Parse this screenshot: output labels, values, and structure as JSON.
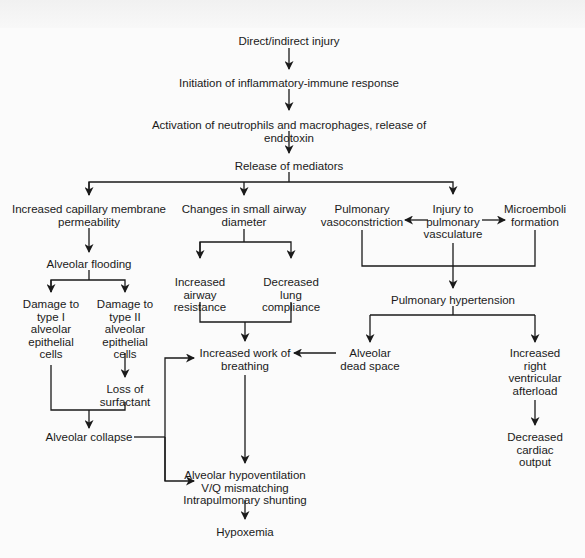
{
  "diagram": {
    "type": "flowchart",
    "nodes": {
      "injury": "Direct/indirect injury",
      "inflammatory": "Initiation of inflammatory-immune response",
      "activation": "Activation of neutrophils and macrophages, release of endotoxin",
      "mediators": "Release of mediators",
      "permeability": "Increased capillary membrane\npermeability",
      "airway_diameter": "Changes in small airway\ndiameter",
      "vasoconstriction": "Pulmonary\nvasoconstriction",
      "vasculature_injury": "Injury to\npulmonary\nvasculature",
      "microemboli": "Microemboli\nformation",
      "flooding": "Alveolar flooding",
      "airway_resistance": "Increased\nairway\nresistance",
      "lung_compliance": "Decreased\nlung\ncompliance",
      "pulm_hypertension": "Pulmonary hypertension",
      "type1_damage": "Damage to\ntype I\nalveolar\nepithelial\ncells",
      "type2_damage": "Damage to\ntype II\nalveolar\nepithelial\ncells",
      "work_of_breathing": "Increased work of\nbreathing",
      "dead_space": "Alveolar\ndead space",
      "rv_afterload": "Increased\nright\nventricular\nafterload",
      "surfactant_loss": "Loss of\nsurfactant",
      "collapse": "Alveolar collapse",
      "cardiac_output": "Decreased\ncardiac\noutput",
      "gas_exchange": "Alveolar hypoventilation\nV/Q mismatching\nIntrapulmonary shunting",
      "hypoxemia": "Hypoxemia"
    },
    "edges": [
      [
        "injury",
        "inflammatory"
      ],
      [
        "inflammatory",
        "activation"
      ],
      [
        "activation",
        "mediators"
      ],
      [
        "mediators",
        "permeability"
      ],
      [
        "mediators",
        "airway_diameter"
      ],
      [
        "mediators",
        "vasculature_injury"
      ],
      [
        "vasculature_injury",
        "vasoconstriction"
      ],
      [
        "vasculature_injury",
        "microemboli"
      ],
      [
        "permeability",
        "flooding"
      ],
      [
        "flooding",
        "type1_damage"
      ],
      [
        "flooding",
        "type2_damage"
      ],
      [
        "type2_damage",
        "surfactant_loss"
      ],
      [
        "type1_damage",
        "collapse"
      ],
      [
        "surfactant_loss",
        "collapse"
      ],
      [
        "airway_diameter",
        "airway_resistance"
      ],
      [
        "airway_diameter",
        "lung_compliance"
      ],
      [
        "airway_resistance",
        "work_of_breathing"
      ],
      [
        "lung_compliance",
        "work_of_breathing"
      ],
      [
        "vasoconstriction",
        "pulm_hypertension"
      ],
      [
        "vasculature_injury",
        "pulm_hypertension"
      ],
      [
        "microemboli",
        "pulm_hypertension"
      ],
      [
        "pulm_hypertension",
        "dead_space"
      ],
      [
        "pulm_hypertension",
        "rv_afterload"
      ],
      [
        "dead_space",
        "work_of_breathing"
      ],
      [
        "rv_afterload",
        "cardiac_output"
      ],
      [
        "collapse",
        "work_of_breathing"
      ],
      [
        "collapse",
        "gas_exchange"
      ],
      [
        "work_of_breathing",
        "gas_exchange"
      ],
      [
        "gas_exchange",
        "hypoxemia"
      ]
    ],
    "colors": {
      "background": "#fbfbfb",
      "ink": "#1a1a1a"
    }
  }
}
